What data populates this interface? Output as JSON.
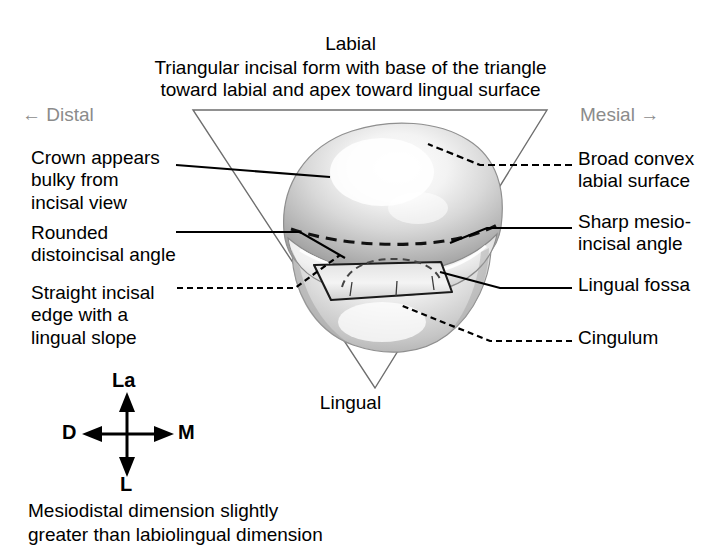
{
  "header": {
    "title": "Labial",
    "subtitle_line1": "Triangular incisal form with base of the triangle",
    "subtitle_line2": "toward labial and apex toward lingual surface"
  },
  "orientation": {
    "distal": "← Distal",
    "mesial": "Mesial →"
  },
  "labels": {
    "crown_bulky": "Crown appears\nbulky from\nincisal view",
    "rounded_distoincisal": "Rounded\ndistoincisal angle",
    "straight_incisal": "Straight incisal\nedge with a\nlingual slope",
    "broad_convex": "Broad convex\nlabial surface",
    "sharp_mesioincisal": "Sharp mesio-\nincisal angle",
    "lingual_fossa": "Lingual fossa",
    "cingulum": "Cingulum",
    "lingual_bottom": "Lingual"
  },
  "compass": {
    "up": "La",
    "left": "D",
    "right": "M",
    "down": "L"
  },
  "footer": {
    "line1": "Mesiodistal dimension slightly",
    "line2": "greater than labiolingual dimension"
  },
  "colors": {
    "text": "#000000",
    "orientation_text": "#8b8b8b",
    "triangle_stroke": "#6e6e6e",
    "leader_stroke": "#000000",
    "background": "#ffffff",
    "tooth_light": "#ffffff",
    "tooth_mid": "#c9c9c9",
    "tooth_dark": "#9a9a9a"
  }
}
